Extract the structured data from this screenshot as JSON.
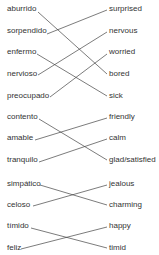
{
  "groups": [
    {
      "left": [
        {
          "text": "aburrido",
          "y": 10
        },
        {
          "text": "sorpendido",
          "y": 32
        },
        {
          "text": "enfermo",
          "y": 53
        },
        {
          "text": "nervioso",
          "y": 75
        },
        {
          "text": "preocupado",
          "y": 97
        }
      ],
      "right": [
        {
          "text": "surprised",
          "y": 10
        },
        {
          "text": "nervous",
          "y": 32
        },
        {
          "text": "worried",
          "y": 53
        },
        {
          "text": "bored",
          "y": 75
        },
        {
          "text": "sick",
          "y": 97
        }
      ]
    },
    {
      "left": [
        {
          "text": "contento",
          "y": 118
        },
        {
          "text": "amable",
          "y": 139
        },
        {
          "text": "tranquilo",
          "y": 161
        }
      ],
      "right": [
        {
          "text": "friendly",
          "y": 118
        },
        {
          "text": "calm",
          "y": 139
        },
        {
          "text": "glad/satisfied",
          "y": 161
        }
      ]
    },
    {
      "left": [
        {
          "text": "simpático",
          "y": 185
        },
        {
          "text": "celoso",
          "y": 206
        }
      ],
      "right": [
        {
          "text": "jealous",
          "y": 185
        },
        {
          "text": "charming",
          "y": 206
        }
      ]
    },
    {
      "left": [
        {
          "text": "tímido",
          "y": 227
        },
        {
          "text": "feliz",
          "y": 249
        }
      ],
      "right": [
        {
          "text": "happy",
          "y": 227
        },
        {
          "text": "timid",
          "y": 249
        }
      ]
    }
  ],
  "connections": [
    {
      "from": "aburrido",
      "to": "bored",
      "x1": 38,
      "y1": 12,
      "x2": 107,
      "y2": 74
    },
    {
      "from": "sorpendido",
      "to": "surprised",
      "x1": 47,
      "y1": 34,
      "x2": 107,
      "y2": 10
    },
    {
      "from": "enfermo",
      "to": "sick",
      "x1": 37,
      "y1": 54,
      "x2": 107,
      "y2": 96
    },
    {
      "from": "nervioso",
      "to": "nervous",
      "x1": 38,
      "y1": 75,
      "x2": 107,
      "y2": 32
    },
    {
      "from": "preocupado",
      "to": "worried",
      "x1": 50,
      "y1": 97,
      "x2": 107,
      "y2": 54
    },
    {
      "from": "contento",
      "to": "glad/satisfied",
      "x1": 39,
      "y1": 119,
      "x2": 107,
      "y2": 160
    },
    {
      "from": "amable",
      "to": "friendly",
      "x1": 35,
      "y1": 140,
      "x2": 107,
      "y2": 118
    },
    {
      "from": "tranquilo",
      "to": "calm",
      "x1": 39,
      "y1": 162,
      "x2": 107,
      "y2": 139
    },
    {
      "from": "simpático",
      "to": "charming",
      "x1": 40,
      "y1": 185,
      "x2": 107,
      "y2": 205
    },
    {
      "from": "celoso",
      "to": "jealous",
      "x1": 33,
      "y1": 206,
      "x2": 107,
      "y2": 185
    },
    {
      "from": "tímido",
      "to": "timid",
      "x1": 31,
      "y1": 228,
      "x2": 107,
      "y2": 248
    },
    {
      "from": "feliz",
      "to": "happy",
      "x1": 21,
      "y1": 249,
      "x2": 107,
      "y2": 227
    }
  ],
  "layout": {
    "left_x": 7,
    "right_x": 109
  }
}
